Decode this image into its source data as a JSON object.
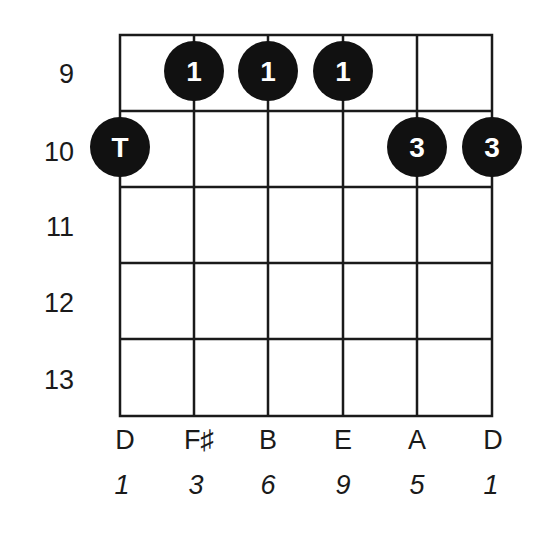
{
  "diagram": {
    "type": "guitar-chord-diagram",
    "start_fret": 9,
    "fret_labels": [
      "9",
      "10",
      "11",
      "12",
      "13"
    ],
    "strings": [
      {
        "note": "D",
        "degree": "1"
      },
      {
        "note": "F♯",
        "degree": "3"
      },
      {
        "note": "B",
        "degree": "6"
      },
      {
        "note": "E",
        "degree": "9"
      },
      {
        "note": "A",
        "degree": "5"
      },
      {
        "note": "D",
        "degree": "1"
      }
    ],
    "dots": [
      {
        "string": 0,
        "fret": 10,
        "label": "T"
      },
      {
        "string": 1,
        "fret": 9,
        "label": "1"
      },
      {
        "string": 2,
        "fret": 9,
        "label": "1"
      },
      {
        "string": 3,
        "fret": 9,
        "label": "1"
      },
      {
        "string": 4,
        "fret": 10,
        "label": "3"
      },
      {
        "string": 5,
        "fret": 10,
        "label": "3"
      }
    ],
    "colors": {
      "line": "#1a1a1a",
      "dot": "#111111",
      "dot_text": "#ffffff"
    }
  }
}
